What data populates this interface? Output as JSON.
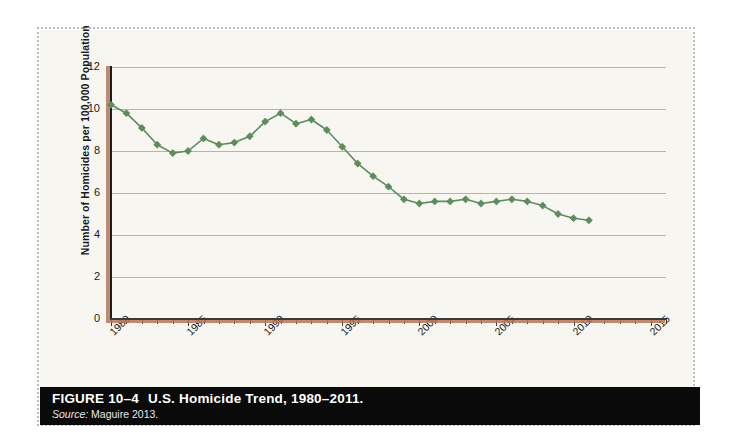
{
  "figure": {
    "caption_label": "FIGURE 10–4",
    "caption_title": "U.S. Homicide Trend, 1980–2011.",
    "source_label": "Source:",
    "source_text": "Maguire 2013."
  },
  "colors": {
    "series_green": "#5f8c5f",
    "axis_shadow_brown": "#b5765c",
    "axis_dark": "#1c1c1c",
    "gridline_gray": "#b4b4b4",
    "panel_cream": "#f7f6f1",
    "caption_bar": "#0a0a0a"
  },
  "chart_data": {
    "type": "line",
    "title": "U.S. Homicide Trend, 1980–2011.",
    "xlabel": "",
    "ylabel": "Number of Homicides per 100,000 Population",
    "ylim": [
      0,
      12
    ],
    "xlim": [
      1980,
      2016
    ],
    "ytick_labels": [
      "0",
      "2",
      "4",
      "6",
      "8",
      "10",
      "12"
    ],
    "yticks": [
      0,
      2,
      4,
      6,
      8,
      10,
      12
    ],
    "xtick_labels": [
      "1980",
      "1985",
      "1990",
      "1995",
      "2000",
      "2005",
      "2010",
      "2015"
    ],
    "xticks": [
      1980,
      1985,
      1990,
      1995,
      2000,
      2005,
      2010,
      2015
    ],
    "minor_xtick_interval": 1,
    "grid": "horizontal",
    "legend": "none",
    "marker": "diamond",
    "series": [
      {
        "name": "U.S. homicide rate per 100,000",
        "x": [
          1980,
          1981,
          1982,
          1983,
          1984,
          1985,
          1986,
          1987,
          1988,
          1989,
          1990,
          1991,
          1992,
          1993,
          1994,
          1995,
          1996,
          1997,
          1998,
          1999,
          2000,
          2001,
          2002,
          2003,
          2004,
          2005,
          2006,
          2007,
          2008,
          2009,
          2010,
          2011
        ],
        "values": [
          10.2,
          9.8,
          9.1,
          8.3,
          7.9,
          8.0,
          8.6,
          8.3,
          8.4,
          8.7,
          9.4,
          9.8,
          9.3,
          9.5,
          9.0,
          8.2,
          7.4,
          6.8,
          6.3,
          5.7,
          5.5,
          5.6,
          5.6,
          5.7,
          5.5,
          5.6,
          5.7,
          5.6,
          5.4,
          5.0,
          4.8,
          4.7
        ]
      }
    ]
  }
}
